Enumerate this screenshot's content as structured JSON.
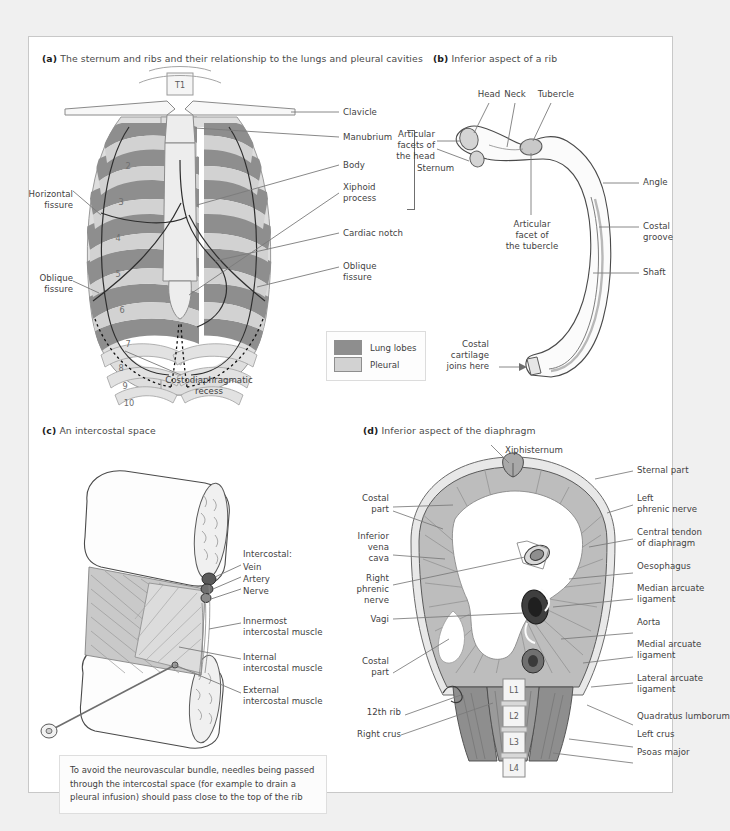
{
  "figure": {
    "panels": [
      {
        "key": "a",
        "tag": "(a)",
        "title": "The sternum and ribs and their relationship to the lungs and pleural cavities",
        "vertebra_label": "T1",
        "rib_numbers": [
          "2",
          "3",
          "4",
          "5",
          "6",
          "7",
          "8",
          "9",
          "10"
        ],
        "labels_left": [
          {
            "id": "horizontal-fissure",
            "text": "Horizontal\nfissure"
          },
          {
            "id": "oblique-fissure-left",
            "text": "Oblique\nfissure"
          }
        ],
        "labels_right": [
          {
            "id": "clavicle",
            "text": "Clavicle"
          },
          {
            "id": "manubrium",
            "text": "Manubrium"
          },
          {
            "id": "body",
            "text": "Body"
          },
          {
            "id": "xiphoid-process",
            "text": "Xiphoid\nprocess"
          },
          {
            "id": "cardiac-notch",
            "text": "Cardiac notch"
          },
          {
            "id": "oblique-fissure-right",
            "text": "Oblique\nfissure"
          }
        ],
        "bracket_label": "Sternum",
        "labels_bottom": [
          {
            "id": "costodiaphragmatic-recess",
            "text": "Costodiaphragmatic\nrecess"
          }
        ],
        "legend": [
          {
            "id": "lung-lobes",
            "label": "Lung lobes",
            "color": "#8e8e8e"
          },
          {
            "id": "pleural",
            "label": "Pleural",
            "color": "#d2d2d2"
          }
        ]
      },
      {
        "key": "b",
        "tag": "(b)",
        "title": "Inferior aspect of a rib",
        "labels": [
          {
            "id": "head",
            "text": "Head"
          },
          {
            "id": "neck",
            "text": "Neck"
          },
          {
            "id": "tubercle",
            "text": "Tubercle"
          },
          {
            "id": "articular-facets-of-the-head",
            "text": "Articular\nfacets of\nthe head"
          },
          {
            "id": "articular-facet-of-the-tubercle",
            "text": "Articular\nfacet of\nthe tubercle"
          },
          {
            "id": "angle",
            "text": "Angle"
          },
          {
            "id": "costal-groove",
            "text": "Costal\ngroove"
          },
          {
            "id": "shaft",
            "text": "Shaft"
          },
          {
            "id": "costal-cartilage-joins-here",
            "text": "Costal\ncartilage\njoins here"
          }
        ]
      },
      {
        "key": "c",
        "tag": "(c)",
        "title": "An intercostal space",
        "labels": [
          {
            "id": "intercostal-group",
            "text": "Intercostal:"
          },
          {
            "id": "vein",
            "text": "Vein"
          },
          {
            "id": "artery",
            "text": "Artery"
          },
          {
            "id": "nerve",
            "text": "Nerve"
          },
          {
            "id": "innermost-intercostal-muscle",
            "text": "Innermost\nintercostal muscle"
          },
          {
            "id": "internal-intercostal-muscle",
            "text": "Internal\nintercostal muscle"
          },
          {
            "id": "external-intercostal-muscle",
            "text": "External\nintercostal muscle"
          }
        ],
        "note": "To avoid the neurovascular bundle, needles being passed through the intercostal space (for example to drain a pleural infusion) should pass close to the top of the rib"
      },
      {
        "key": "d",
        "tag": "(d)",
        "title": "Inferior aspect of the diaphragm",
        "labels_top": [
          {
            "id": "xiphisternum",
            "text": "Xiphisternum"
          }
        ],
        "labels_left": [
          {
            "id": "costal-part-upper",
            "text": "Costal\npart"
          },
          {
            "id": "inferior-vena-cava",
            "text": "Inferior\nvena\ncava"
          },
          {
            "id": "right-phrenic-nerve",
            "text": "Right\nphrenic\nnerve"
          },
          {
            "id": "vagi",
            "text": "Vagi"
          },
          {
            "id": "costal-part-lower",
            "text": "Costal\npart"
          },
          {
            "id": "twelfth-rib",
            "text": "12th rib"
          },
          {
            "id": "right-crus",
            "text": "Right crus"
          }
        ],
        "labels_right": [
          {
            "id": "sternal-part",
            "text": "Sternal part"
          },
          {
            "id": "left-phrenic-nerve",
            "text": "Left\nphrenic nerve"
          },
          {
            "id": "central-tendon-of-diaphragm",
            "text": "Central tendon\nof diaphragm"
          },
          {
            "id": "oesophagus",
            "text": "Oesophagus"
          },
          {
            "id": "median-arcuate-ligament",
            "text": "Median arcuate\nligament"
          },
          {
            "id": "aorta",
            "text": "Aorta"
          },
          {
            "id": "medial-arcuate-ligament",
            "text": "Medial arcuate\nligament"
          },
          {
            "id": "lateral-arcuate-ligament",
            "text": "Lateral arcuate\nligament"
          },
          {
            "id": "quadratus-lumborum",
            "text": "Quadratus lumborum"
          },
          {
            "id": "left-crus",
            "text": "Left crus"
          },
          {
            "id": "psoas-major",
            "text": "Psoas major"
          }
        ],
        "vertebrae": [
          "L1",
          "L2",
          "L3",
          "L4"
        ]
      }
    ]
  },
  "colors": {
    "lung": "#8e8e8e",
    "pleural": "#d2d2d2",
    "bone": "#f2f2f2",
    "muscle": "#b9b9b9",
    "muscle_dark": "#8a8a8a",
    "line": "#6e6e6e",
    "text": "#3f3f3f"
  }
}
